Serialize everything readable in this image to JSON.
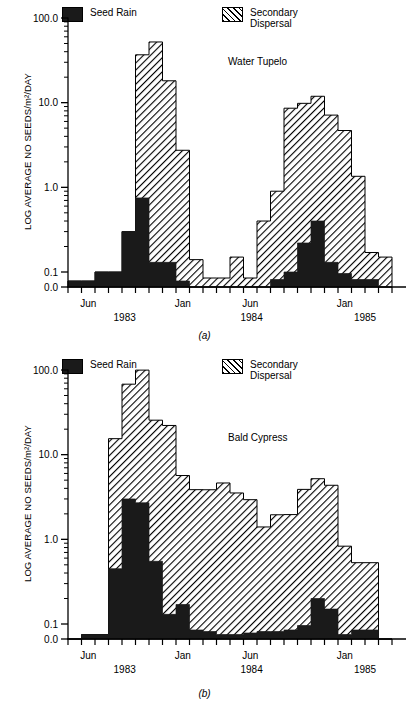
{
  "figure": {
    "legend": {
      "seed_rain": "Seed Rain",
      "secondary_dispersal": "Secondary\nDispersal"
    },
    "axis": {
      "ylabel": "LOG AVERAGE NO SEEDS/m²/DAY",
      "ytick_labels": [
        "100.0",
        "10.0",
        "1.0",
        "0.1",
        "0.0"
      ],
      "xtick_labels": [
        "Jun",
        "Jan",
        "Jun",
        "Jan"
      ],
      "year_labels": [
        "1983",
        "1984",
        "1985"
      ]
    },
    "colors": {
      "seed_rain": "#1a1a1a",
      "secondary_dispersal": "#ffffff",
      "hatch": "#000000",
      "axis": "#000000"
    },
    "panels": [
      {
        "id": "a",
        "sublabel": "(a)",
        "annotation": "Water Tupelo"
      },
      {
        "id": "b",
        "sublabel": "(b)",
        "annotation": "Bald Cypress"
      }
    ]
  },
  "chart_data": [
    {
      "type": "bar",
      "title": "Water Tupelo",
      "panel": "(a)",
      "xlabel": "",
      "ylabel": "LOG AVERAGE NO SEEDS/m²/DAY",
      "yscale": "log",
      "ylim": [
        0.0,
        100.0
      ],
      "yticks": [
        0.0,
        0.1,
        1.0,
        10.0,
        100.0
      ],
      "grid": false,
      "legend_position": "top",
      "stacked": true,
      "categories": [
        "1983-05",
        "1983-06",
        "1983-07",
        "1983-08",
        "1983-09",
        "1983-10",
        "1983-11",
        "1983-12",
        "1984-01",
        "1984-02",
        "1984-03",
        "1984-04",
        "1984-05",
        "1984-06",
        "1984-07",
        "1984-08",
        "1984-09",
        "1984-10",
        "1984-11",
        "1984-12",
        "1985-01",
        "1985-02",
        "1985-03",
        "1985-04"
      ],
      "x_axis_ticks_labeled": {
        "1983-06": "Jun",
        "1984-01": "Jan",
        "1984-06": "Jun",
        "1985-01": "Jan"
      },
      "series": [
        {
          "name": "Seed Rain",
          "values": [
            0.04,
            0.04,
            0.1,
            0.1,
            0.3,
            0.75,
            0.13,
            0.13,
            0.04,
            0.0,
            0.0,
            0.0,
            0.0,
            0.0,
            0.0,
            0.05,
            0.1,
            0.22,
            0.4,
            0.13,
            0.09,
            0.05,
            0.05,
            0.0
          ]
        },
        {
          "name": "Secondary Dispersal",
          "values": [
            0.0,
            0.0,
            0.0,
            0.0,
            0.0,
            36.0,
            52.0,
            18.0,
            2.7,
            0.14,
            0.06,
            0.06,
            0.15,
            0.06,
            0.4,
            0.85,
            8.5,
            9.6,
            11.5,
            7.0,
            4.6,
            1.3,
            0.12,
            0.15
          ]
        }
      ]
    },
    {
      "type": "bar",
      "title": "Bald Cypress",
      "panel": "(b)",
      "xlabel": "",
      "ylabel": "LOG AVERAGE NO SEEDS/m²/DAY",
      "yscale": "log",
      "ylim": [
        0.0,
        100.0
      ],
      "yticks": [
        0.0,
        0.1,
        1.0,
        10.0,
        100.0
      ],
      "grid": false,
      "legend_position": "top",
      "stacked": true,
      "categories": [
        "1983-05",
        "1983-06",
        "1983-07",
        "1983-08",
        "1983-09",
        "1983-10",
        "1983-11",
        "1983-12",
        "1984-01",
        "1984-02",
        "1984-03",
        "1984-04",
        "1984-05",
        "1984-06",
        "1984-07",
        "1984-08",
        "1984-09",
        "1984-10",
        "1984-11",
        "1984-12",
        "1985-01",
        "1985-02",
        "1985-03",
        "1985-04"
      ],
      "x_axis_ticks_labeled": {
        "1983-06": "Jun",
        "1984-01": "Jan",
        "1984-06": "Jun",
        "1985-01": "Jan"
      },
      "series": [
        {
          "name": "Seed Rain",
          "values": [
            0.0,
            0.03,
            0.03,
            0.45,
            3.0,
            2.7,
            0.55,
            0.13,
            0.17,
            0.06,
            0.05,
            0.03,
            0.03,
            0.04,
            0.05,
            0.05,
            0.06,
            0.09,
            0.2,
            0.15,
            0.03,
            0.06,
            0.06,
            0.0
          ]
        },
        {
          "name": "Secondary Dispersal",
          "values": [
            0.0,
            0.0,
            0.0,
            15.0,
            65.0,
            97.0,
            25.0,
            22.0,
            5.5,
            3.8,
            3.8,
            4.6,
            3.5,
            2.9,
            1.35,
            1.9,
            1.9,
            3.8,
            5.0,
            4.2,
            0.8,
            0.47,
            0.47,
            0.0
          ]
        }
      ]
    }
  ]
}
